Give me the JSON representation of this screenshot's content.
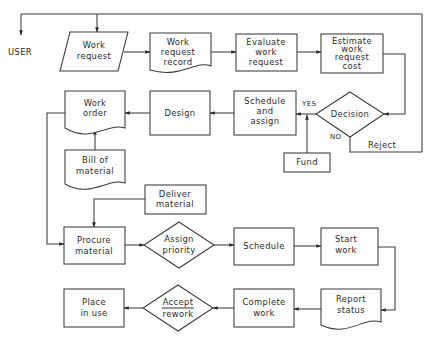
{
  "diagram": {
    "type": "flowchart",
    "external": {
      "user_label": "USER"
    },
    "nodes": {
      "work_request": {
        "shape": "input-parallelogram",
        "lines": [
          "Work",
          "request"
        ]
      },
      "work_request_record": {
        "shape": "document",
        "lines": [
          "Work",
          "request",
          "record"
        ]
      },
      "evaluate": {
        "shape": "process",
        "lines": [
          "Evaluate",
          "work",
          "request"
        ]
      },
      "estimate": {
        "shape": "process",
        "lines": [
          "Estimate",
          "work",
          "request",
          "cost"
        ]
      },
      "decision": {
        "shape": "decision",
        "lines": [
          "Decision"
        ]
      },
      "schedule_assign": {
        "shape": "process",
        "lines": [
          "Schedule",
          "and",
          "assign"
        ]
      },
      "fund": {
        "shape": "process",
        "lines": [
          "Fund"
        ]
      },
      "design": {
        "shape": "process",
        "lines": [
          "Design"
        ]
      },
      "work_order": {
        "shape": "document",
        "lines": [
          "Work",
          "order"
        ]
      },
      "bill_of_material": {
        "shape": "document",
        "lines": [
          "Bill of",
          "material"
        ]
      },
      "deliver_material": {
        "shape": "process",
        "lines": [
          "Deliver",
          "material"
        ]
      },
      "procure_material": {
        "shape": "process",
        "lines": [
          "Procure",
          "material"
        ]
      },
      "assign_priority": {
        "shape": "decision",
        "lines": [
          "Assign",
          "priority"
        ]
      },
      "schedule": {
        "shape": "process",
        "lines": [
          "Schedule"
        ]
      },
      "start_work": {
        "shape": "process",
        "lines": [
          "Start",
          "work"
        ]
      },
      "report_status": {
        "shape": "document",
        "lines": [
          "Report",
          "status"
        ]
      },
      "complete_work": {
        "shape": "process",
        "lines": [
          "Complete",
          "work"
        ]
      },
      "accept_rework": {
        "shape": "decision",
        "lines": [
          "Accept",
          "rework"
        ]
      },
      "place_in_use": {
        "shape": "process",
        "lines": [
          "Place",
          "in use"
        ]
      }
    },
    "edge_labels": {
      "yes": "YES",
      "no": "NO",
      "reject": "Reject"
    },
    "edges": [
      {
        "from": "reject-loop",
        "to": "user"
      },
      {
        "from": "reject-loop",
        "to": "work_request"
      },
      {
        "from": "work_request",
        "to": "work_request_record"
      },
      {
        "from": "work_request_record",
        "to": "evaluate"
      },
      {
        "from": "evaluate",
        "to": "estimate"
      },
      {
        "from": "estimate",
        "to": "decision"
      },
      {
        "from": "decision",
        "to": "schedule_assign",
        "label": "YES"
      },
      {
        "from": "decision",
        "to": "reject-loop",
        "label": "NO / Reject"
      },
      {
        "from": "fund",
        "to": "schedule_assign"
      },
      {
        "from": "schedule_assign",
        "to": "design"
      },
      {
        "from": "design",
        "to": "work_order"
      },
      {
        "from": "bill_of_material",
        "to": "work_order"
      },
      {
        "from": "work_order",
        "to": "procure_material"
      },
      {
        "from": "deliver_material",
        "to": "procure_material"
      },
      {
        "from": "procure_material",
        "to": "assign_priority"
      },
      {
        "from": "assign_priority",
        "to": "schedule"
      },
      {
        "from": "schedule",
        "to": "start_work"
      },
      {
        "from": "start_work",
        "to": "report_status"
      },
      {
        "from": "report_status",
        "to": "complete_work"
      },
      {
        "from": "complete_work",
        "to": "accept_rework"
      },
      {
        "from": "accept_rework",
        "to": "place_in_use"
      }
    ]
  }
}
